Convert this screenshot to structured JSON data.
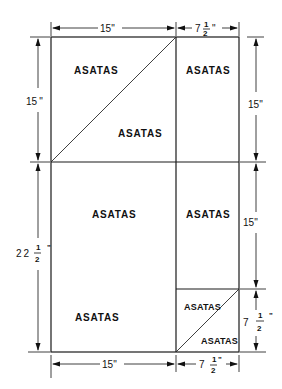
{
  "diagram": {
    "type": "cutting-layout",
    "panel_label": "ASATAS",
    "regions": [
      {
        "id": "top-left-upper-triangle",
        "label": "ASATAS"
      },
      {
        "id": "top-left-lower-triangle",
        "label": "ASATAS"
      },
      {
        "id": "top-right",
        "label": "ASATAS"
      },
      {
        "id": "mid-left",
        "label": "ASATAS"
      },
      {
        "id": "mid-right",
        "label": "ASATAS"
      },
      {
        "id": "bottom-left",
        "label": "ASATAS"
      },
      {
        "id": "bottom-right-upper-triangle",
        "label": "ASATAS"
      },
      {
        "id": "bottom-right-lower-triangle",
        "label": "ASATAS"
      }
    ],
    "dimensions": {
      "top_left_width": {
        "whole": "15",
        "unit": "\""
      },
      "top_right_width": {
        "whole": "7",
        "num": "1",
        "den": "2",
        "unit": "\""
      },
      "left_upper_height": {
        "whole": "15",
        "unit": "\""
      },
      "left_lower_height": {
        "whole": "22",
        "num": "1",
        "den": "2",
        "unit": "\""
      },
      "right_upper_height": {
        "whole": "15",
        "unit": "\""
      },
      "right_middle_height": {
        "whole": "15",
        "unit": "\""
      },
      "right_lower_height": {
        "whole": "7",
        "num": "1",
        "den": "2",
        "unit": "\""
      },
      "bottom_left_width": {
        "whole": "15",
        "unit": "\""
      },
      "bottom_right_width": {
        "whole": "7",
        "num": "1",
        "den": "2",
        "unit": "\""
      }
    }
  }
}
